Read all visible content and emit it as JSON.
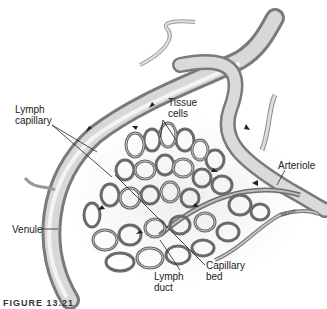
{
  "figure": {
    "labels": {
      "lymph_capillary": "Lymph\ncapillary",
      "tissue_cells": "Tissue\ncells",
      "arteriole": "Arteriole",
      "venule": "Venule",
      "lymph_duct": "Lymph\nduct",
      "capillary_bed": "Capillary\nbed",
      "artist_signature": "Moon"
    },
    "caption": "FIGURE 13.21",
    "colors": {
      "vessel_dark": "#6e6e6e",
      "vessel_mid": "#a9a9a9",
      "vessel_light": "#dcdcdc",
      "background": "#ffffff",
      "text": "#222222"
    }
  }
}
